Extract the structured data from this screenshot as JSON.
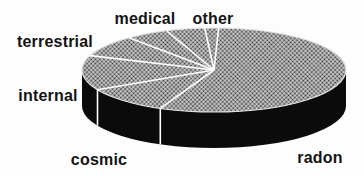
{
  "figure": {
    "background_color": "#fdfdfd",
    "text_color": "#141414"
  },
  "chart_data": {
    "type": "pie",
    "projection": "3d",
    "title": "",
    "legend": "none",
    "data_labels": "outside",
    "slices": [
      {
        "label": "radon",
        "percent": 56
      },
      {
        "label": "cosmic",
        "percent": 11
      },
      {
        "label": "internal",
        "percent": 13
      },
      {
        "label": "terrestrial",
        "percent": 8
      },
      {
        "label": "medical",
        "percent": 10
      },
      {
        "label": "other",
        "percent": 2
      }
    ],
    "wedge_boundary_angles_deg": [
      114,
      152,
      200,
      230,
      249,
      266,
      272
    ],
    "angle_convention": "screen parametric degrees: 0 = 3 o'clock, 90 = 6 o'clock, 270 = 12 o'clock",
    "top_color_avg": "#9a9a9a",
    "top_texture": "halftone-dot-screen",
    "side_color": "#0b0b0b",
    "line_color": "#ffffff",
    "rim_color": "#e0e0e0"
  }
}
